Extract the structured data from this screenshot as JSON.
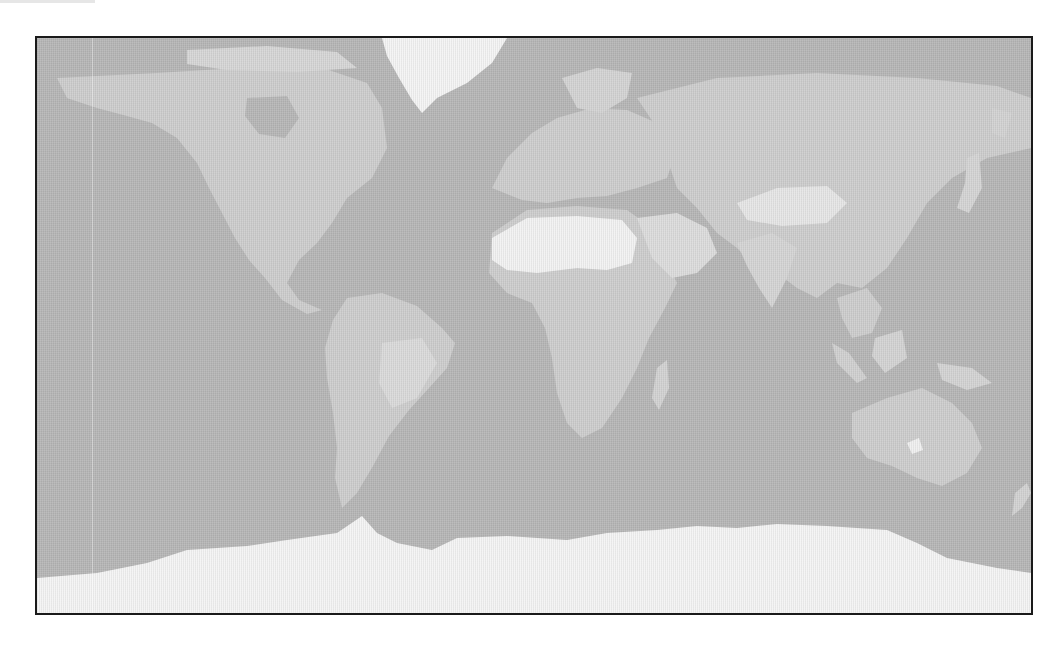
{
  "map": {
    "type": "world-map",
    "projection": "equirectangular",
    "style": "grayscale",
    "colors": {
      "frame": "#1a1a1a",
      "ocean": "#b6b6b6",
      "land": "#cdcdcd",
      "land_light": "#dcdcdc",
      "ice": "#f4f4f4",
      "desert": "#f2f2f2"
    },
    "regions": [
      {
        "name": "North America",
        "tone": "land"
      },
      {
        "name": "Greenland",
        "tone": "ice"
      },
      {
        "name": "South America",
        "tone": "land"
      },
      {
        "name": "Europe",
        "tone": "land"
      },
      {
        "name": "Africa",
        "tone": "land"
      },
      {
        "name": "Sahara",
        "tone": "desert"
      },
      {
        "name": "Arabian Peninsula",
        "tone": "land_light"
      },
      {
        "name": "Asia",
        "tone": "land"
      },
      {
        "name": "Tibetan Plateau",
        "tone": "land_light"
      },
      {
        "name": "Southeast Asia",
        "tone": "land"
      },
      {
        "name": "Australia",
        "tone": "land"
      },
      {
        "name": "Antarctica",
        "tone": "ice"
      }
    ]
  }
}
